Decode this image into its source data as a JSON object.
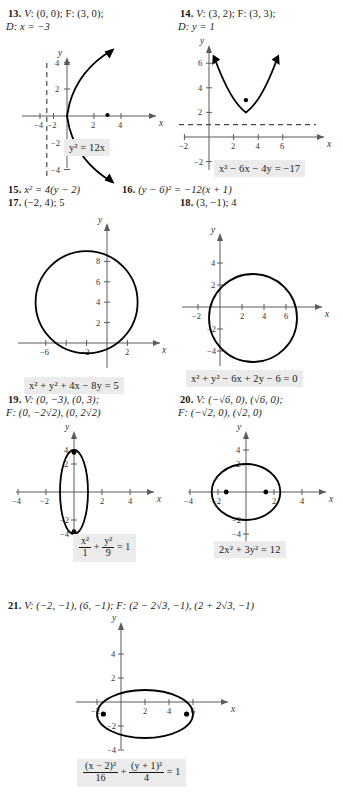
{
  "page": {
    "kind": "textbook-answer-key-conic-sections",
    "background_color": "#ffffff",
    "equation_highlight_color": "#ebebeb"
  },
  "items": [
    {
      "number": "13.",
      "line1_prefix": "V",
      "line1": ": (0, 0); F: (3, 0);",
      "line2": "D: x = −3",
      "equation_plain": "y² = 12x",
      "graph": {
        "type": "parabola",
        "opens": "right",
        "vertex": [
          0,
          0
        ],
        "focus": [
          3,
          0
        ],
        "directrix": "x = -3",
        "x_ticks": [
          -4,
          -2,
          2,
          4
        ],
        "y_ticks": [
          -4,
          -2,
          2,
          4
        ],
        "x_axis_label": "x",
        "y_axis_label": "y"
      }
    },
    {
      "number": "14.",
      "line1_prefix": "V",
      "line1": ": (3, 2); F: (3, 3);",
      "line2": "D: y = 1",
      "equation_plain": "x² − 6x − 4y = −17",
      "graph": {
        "type": "parabola",
        "opens": "up",
        "vertex": [
          3,
          2
        ],
        "focus": [
          3,
          3
        ],
        "directrix": "y = 1",
        "x_ticks": [
          -2,
          2,
          4,
          6
        ],
        "y_ticks": [
          -2,
          2,
          4,
          6
        ],
        "x_axis_label": "x",
        "y_axis_label": "y"
      }
    },
    {
      "number": "15.",
      "text": "x² = 4(y − 2)"
    },
    {
      "number": "16.",
      "text": "(y − 6)² = −12(x + 1)"
    },
    {
      "number": "17.",
      "text": "(−2, 4); 5",
      "equation_plain": "x² + y² + 4x − 8y = 5",
      "graph": {
        "type": "circle",
        "center": [
          -2,
          4
        ],
        "radius": 5,
        "x_ticks": [
          -6,
          -4,
          -2,
          2
        ],
        "y_ticks": [
          2,
          4,
          6,
          8
        ],
        "x_axis_label": "x",
        "y_axis_label": "y"
      }
    },
    {
      "number": "18.",
      "text": "(3, −1); 4",
      "equation_plain": "x² + y² − 6x + 2y − 6 = 0",
      "graph": {
        "type": "circle",
        "center": [
          3,
          -1
        ],
        "radius": 4,
        "x_ticks": [
          -2,
          2,
          4,
          6
        ],
        "y_ticks": [
          -4,
          -2,
          2,
          4
        ],
        "x_axis_label": "x",
        "y_axis_label": "y"
      }
    },
    {
      "number": "19.",
      "line1": "V: (0, −3), (0, 3);",
      "line2": "F: (0, −2√2), (0, 2√2)",
      "equation_fraction": {
        "num1": "x²",
        "den1": "1",
        "op": "+",
        "num2": "y²",
        "den2": "9",
        "rhs": "= 1"
      },
      "graph": {
        "type": "ellipse",
        "center": [
          0,
          0
        ],
        "a_x": 1,
        "a_y": 3,
        "foci": [
          [
            0,
            -2.828
          ],
          [
            0,
            2.828
          ]
        ],
        "x_ticks": [
          -4,
          -2,
          2,
          4
        ],
        "y_ticks": [
          -4,
          -2,
          2,
          4
        ],
        "x_axis_label": "x",
        "y_axis_label": "y"
      }
    },
    {
      "number": "20.",
      "line1": "V: (−√6, 0), (√6, 0);",
      "line2": "F: (−√2, 0), (√2, 0)",
      "equation_plain": "2x² + 3y² = 12",
      "graph": {
        "type": "ellipse",
        "center": [
          0,
          0
        ],
        "a_x": 2.449,
        "a_y": 2,
        "foci": [
          [
            -1.414,
            0
          ],
          [
            1.414,
            0
          ]
        ],
        "x_ticks": [
          -4,
          -2,
          2,
          4
        ],
        "y_ticks": [
          -4,
          -2,
          2,
          4
        ],
        "x_axis_label": "x",
        "y_axis_label": "y"
      }
    },
    {
      "number": "21.",
      "line1": "V: (−2, −1), (6, −1); F: (2 − 2√3, −1), (2 + 2√3, −1)",
      "equation_fraction": {
        "num1": "(x − 2)²",
        "den1": "16",
        "op": "+",
        "num2": "(y + 1)²",
        "den2": "4",
        "rhs": "= 1"
      },
      "graph": {
        "type": "ellipse",
        "center": [
          2,
          -1
        ],
        "a_x": 4,
        "a_y": 2,
        "foci": [
          [
            -1.464,
            -1
          ],
          [
            5.464,
            -1
          ]
        ],
        "x_ticks": [
          -2,
          2,
          4,
          6
        ],
        "y_ticks": [
          -4,
          -2,
          2,
          4
        ],
        "x_axis_label": "x",
        "y_axis_label": "y"
      }
    }
  ]
}
